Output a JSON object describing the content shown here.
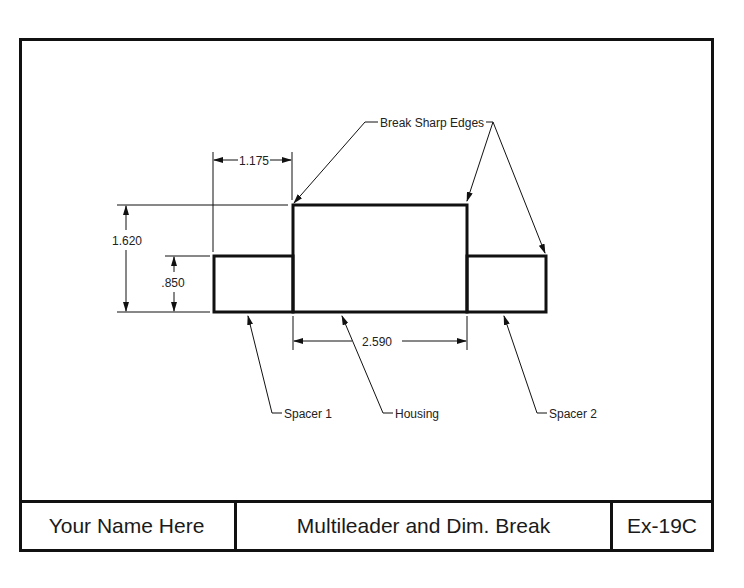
{
  "drawing": {
    "dimensions": {
      "horizontal_offset": "1.175",
      "overall_height": "1.620",
      "spacer_height": ".850",
      "housing_width": "2.590"
    },
    "leaders": {
      "break_sharp_edges": "Break Sharp Edges",
      "spacer_1": "Spacer 1",
      "housing": "Housing",
      "spacer_2": "Spacer 2"
    },
    "colors": {
      "line": "#111111",
      "background": "#ffffff"
    }
  },
  "title_block": {
    "name": "Your Name Here",
    "title": "Multileader and Dim. Break",
    "number": "Ex-19C"
  }
}
